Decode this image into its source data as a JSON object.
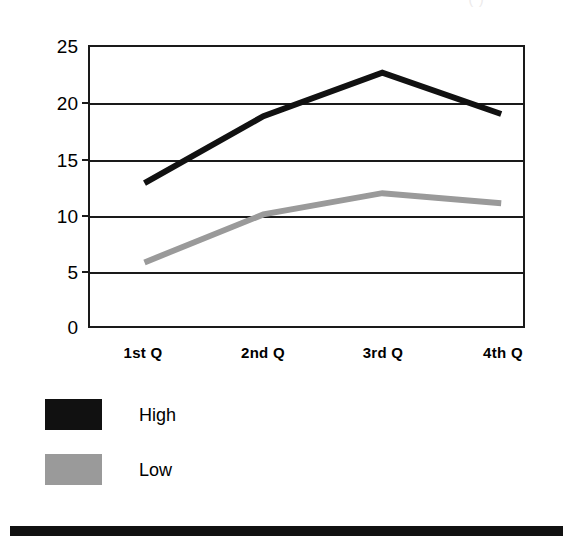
{
  "figure": {
    "clipped_title_fragment": "(          )",
    "background_color": "#ffffff",
    "bottom_rule_color": "#111111"
  },
  "axes": {
    "y_ticks": [
      "25",
      "20",
      "15",
      "10",
      "5",
      "0"
    ],
    "x_ticks": [
      "1st Q",
      "2nd Q",
      "3rd Q",
      "4th Q"
    ]
  },
  "legend": {
    "items": [
      {
        "label": "High",
        "color": "#111111"
      },
      {
        "label": "Low",
        "color": "#9a9a9a"
      }
    ]
  },
  "chart_data": {
    "type": "line",
    "title": "",
    "xlabel": "",
    "ylabel": "",
    "categories": [
      "1st Q",
      "2nd Q",
      "3rd Q",
      "4th Q"
    ],
    "series": [
      {
        "name": "High",
        "color": "#111111",
        "values": [
          12.8,
          18.8,
          22.7,
          19.0
        ]
      },
      {
        "name": "Low",
        "color": "#9a9a9a",
        "values": [
          5.7,
          10.0,
          11.9,
          11.0
        ]
      }
    ],
    "ylim": [
      0,
      25
    ],
    "y_ticks": [
      0,
      5,
      10,
      15,
      20,
      25
    ],
    "grid": true,
    "grid_axis": "y",
    "legend_position": "below-left",
    "line_width": 6
  }
}
